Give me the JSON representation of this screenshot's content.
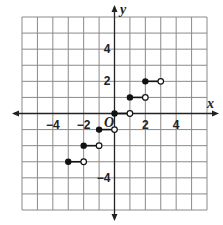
{
  "chart_data": {
    "type": "line",
    "title": "",
    "xlabel": "x",
    "ylabel": "y",
    "origin_label": "O",
    "xlim": [
      -6,
      6
    ],
    "ylim": [
      -6,
      6
    ],
    "grid": true,
    "grid_step": 1,
    "x_tick_labels": [
      {
        "value": -4,
        "label": "−4"
      },
      {
        "value": -2,
        "label": "−2"
      },
      {
        "value": 2,
        "label": "2"
      },
      {
        "value": 4,
        "label": "4"
      }
    ],
    "y_tick_labels": [
      {
        "value": 4,
        "label": "4"
      },
      {
        "value": 2,
        "label": "2"
      },
      {
        "value": -4,
        "label": "−4"
      }
    ],
    "series": [
      {
        "name": "step function",
        "description": "Greatest integer (floor) step function",
        "segments": [
          {
            "x_start": -3,
            "x_end": -2,
            "y": -3,
            "start": "closed",
            "end": "open"
          },
          {
            "x_start": -2,
            "x_end": -1,
            "y": -2,
            "start": "closed",
            "end": "open"
          },
          {
            "x_start": -1,
            "x_end": 0,
            "y": -1,
            "start": "closed",
            "end": "open"
          },
          {
            "x_start": 0,
            "x_end": 1,
            "y": 0,
            "start": "closed",
            "end": "open"
          },
          {
            "x_start": 1,
            "x_end": 2,
            "y": 1,
            "start": "closed",
            "end": "open"
          },
          {
            "x_start": 2,
            "x_end": 3,
            "y": 2,
            "start": "closed",
            "end": "open"
          }
        ]
      }
    ],
    "colors": {
      "grid": "#8a8a8a",
      "axis": "#222222",
      "points": "#111111",
      "background": "#ffffff"
    }
  }
}
